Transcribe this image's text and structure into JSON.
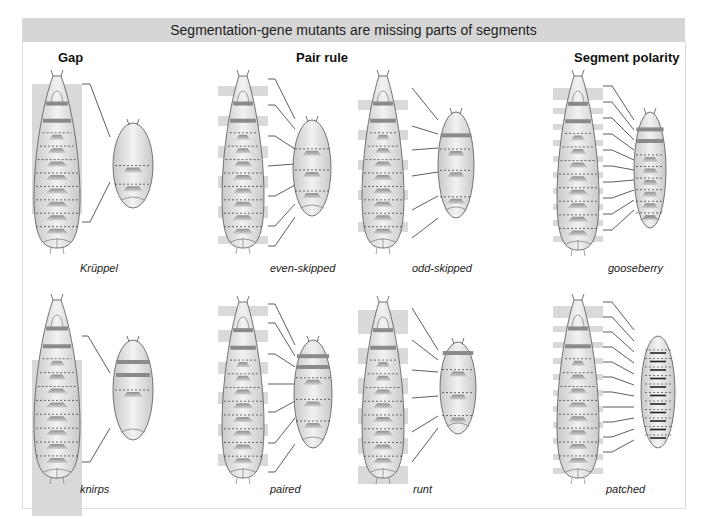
{
  "title": "Segmentation-gene mutants are missing parts of segments",
  "categories": [
    {
      "label": "Gap",
      "x": 70,
      "y": 47
    },
    {
      "label": "Pair rule",
      "x": 325,
      "y": 47
    },
    {
      "label": "Segment polarity",
      "x": 574,
      "y": 47
    }
  ],
  "mutants": [
    {
      "name": "Krüppel",
      "category": "Gap",
      "row": 1,
      "caption_x": 80,
      "caption_y": 262
    },
    {
      "name": "even-skipped",
      "category": "Pair rule",
      "row": 1,
      "caption_x": 270,
      "caption_y": 262
    },
    {
      "name": "odd-skipped",
      "category": "Pair rule",
      "row": 1,
      "caption_x": 412,
      "caption_y": 262
    },
    {
      "name": "gooseberry",
      "category": "Segment polarity",
      "row": 1,
      "caption_x": 608,
      "caption_y": 262
    },
    {
      "name": "knirps",
      "category": "Gap",
      "row": 2,
      "caption_x": 80,
      "caption_y": 483
    },
    {
      "name": "paired",
      "category": "Pair rule",
      "row": 2,
      "caption_x": 270,
      "caption_y": 483
    },
    {
      "name": "runt",
      "category": "Pair rule",
      "row": 2,
      "caption_x": 413,
      "caption_y": 483
    },
    {
      "name": "patched",
      "category": "Segment polarity",
      "row": 2,
      "caption_x": 606,
      "caption_y": 483
    }
  ],
  "colors": {
    "banner": "#d6d6d6",
    "deleted_region": "#d9d9d9",
    "larva_body": "#e4e4e4",
    "band": "#8a8a8a",
    "denticle": "#9c9c9c"
  }
}
